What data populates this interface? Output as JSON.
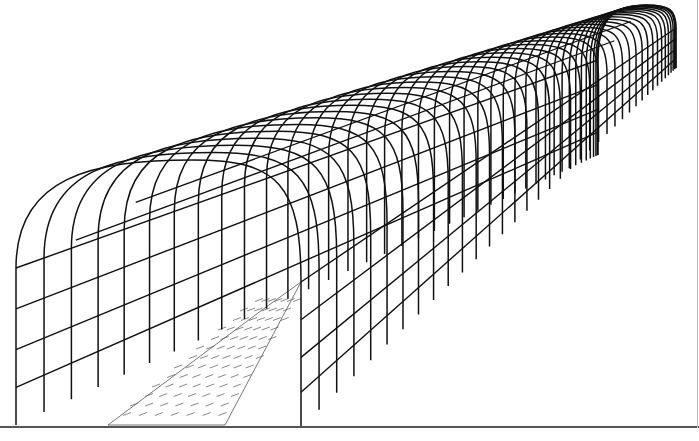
{
  "illustration": {
    "subject": "arched-tunnel-trellis-with-paved-path",
    "colors": {
      "background": "#ffffff",
      "line": "#111111",
      "paving": "#555555",
      "rule": "#555555"
    },
    "arch_count": 40,
    "front_arch": {
      "left_x": 16,
      "right_x": 301,
      "base_y": 425,
      "shoulder_left_y": 268,
      "shoulder_right_y": 282,
      "crown_y": 160
    },
    "far_arch": {
      "left_x": 598,
      "right_x": 676,
      "base_y_left": 155,
      "base_y_right": 68,
      "shoulder_left_y": 60,
      "shoulder_right_y": 28,
      "crown_y": 5
    },
    "rails": {
      "side_fraction": [
        0.26,
        0.52,
        0.76
      ],
      "roof_fraction": [
        0.35,
        0.7
      ]
    },
    "path": {
      "front_left_x": 108,
      "front_right_x": 225,
      "front_y": 425,
      "far_y": 282,
      "far_left_x": 262,
      "far_right_x": 301
    }
  }
}
